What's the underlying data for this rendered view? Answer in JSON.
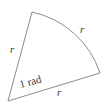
{
  "diagram": {
    "type": "circular-sector",
    "labels": {
      "radius_left": "r",
      "arc": "r",
      "radius_bottom": "r",
      "angle": "1 rad"
    },
    "colors": {
      "stroke": "#8c8c8c",
      "text": "#3a3a3a",
      "background": "#ffffff"
    }
  }
}
